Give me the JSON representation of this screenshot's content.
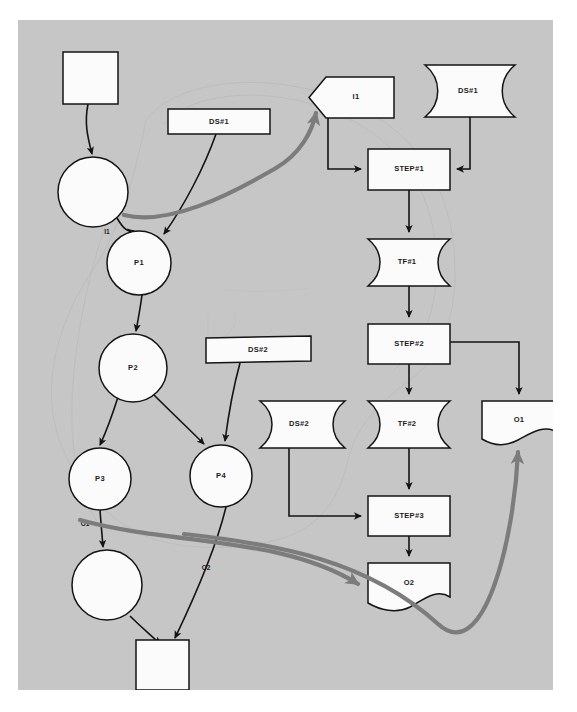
{
  "caption": {
    "clipped_text_top": ""
  },
  "diagram": {
    "type": "dfd-to-flowchart-mapping",
    "background_color": "#c6c6c6",
    "node_fill": "#fbfbfb",
    "node_stroke": "#141414",
    "mapping_arrow_color": "#7c7c7c",
    "boundary_color": "#bdbdbd",
    "left_panel_title": "",
    "right_panel_title": "",
    "dfd_nodes": [
      {
        "id": "ext-source",
        "label": "",
        "shape": "rectangle",
        "x": 45,
        "y": 32,
        "w": 55,
        "h": 52
      },
      {
        "id": "ds1-store",
        "label": "DS#1",
        "shape": "open-rectangle",
        "x": 150,
        "y": 89,
        "w": 102,
        "h": 25
      },
      {
        "id": "proc-top",
        "label": "",
        "shape": "circle",
        "cx": 75,
        "cy": 172,
        "r": 35
      },
      {
        "id": "p1",
        "label": "P1",
        "shape": "circle",
        "cx": 121,
        "cy": 243,
        "r": 32
      },
      {
        "id": "p2",
        "label": "P2",
        "shape": "circle",
        "cx": 115,
        "cy": 348,
        "r": 34
      },
      {
        "id": "ds2-store",
        "label": "DS#2",
        "shape": "open-rectangle",
        "x": 188,
        "y": 318,
        "w": 105,
        "h": 25
      },
      {
        "id": "p3",
        "label": "P3",
        "shape": "circle",
        "cx": 82,
        "cy": 459,
        "r": 31
      },
      {
        "id": "p4",
        "label": "P4",
        "shape": "circle",
        "cx": 203,
        "cy": 456,
        "r": 31
      },
      {
        "id": "proc-bottom",
        "label": "",
        "shape": "circle",
        "cx": 89,
        "cy": 565,
        "r": 35
      },
      {
        "id": "ext-sink",
        "label": "",
        "shape": "rectangle",
        "x": 118,
        "y": 620,
        "w": 53,
        "h": 50
      }
    ],
    "dfd_edge_labels": [
      {
        "id": "edge-i1",
        "label": "I1",
        "x": 89,
        "y": 212
      },
      {
        "id": "edge-o1",
        "label": "O1",
        "x": 67,
        "y": 504
      },
      {
        "id": "edge-o2",
        "label": "O2",
        "x": 188,
        "y": 548
      }
    ],
    "flowchart_nodes": [
      {
        "id": "fc-i1",
        "label": "I1",
        "shape": "input-pentagon",
        "x": 291,
        "y": 57,
        "w": 85,
        "h": 41
      },
      {
        "id": "fc-ds1",
        "label": "DS#1",
        "shape": "stored-data",
        "x": 407,
        "y": 45,
        "w": 90,
        "h": 52
      },
      {
        "id": "fc-step1",
        "label": "STEP#1",
        "shape": "process",
        "x": 350,
        "y": 129,
        "w": 82,
        "h": 41
      },
      {
        "id": "fc-tf1",
        "label": "TF#1",
        "shape": "stored-data",
        "x": 350,
        "y": 219,
        "w": 82,
        "h": 47
      },
      {
        "id": "fc-step2",
        "label": "STEP#2",
        "shape": "process",
        "x": 350,
        "y": 304,
        "w": 82,
        "h": 40
      },
      {
        "id": "fc-ds2",
        "label": "DS#2",
        "shape": "stored-data",
        "x": 242,
        "y": 381,
        "w": 85,
        "h": 47
      },
      {
        "id": "fc-tf2",
        "label": "TF#2",
        "shape": "stored-data",
        "x": 350,
        "y": 381,
        "w": 82,
        "h": 47
      },
      {
        "id": "fc-o1",
        "label": "O1",
        "shape": "document",
        "x": 464,
        "y": 381,
        "w": 75,
        "h": 46
      },
      {
        "id": "fc-step3",
        "label": "STEP#3",
        "shape": "process",
        "x": 350,
        "y": 476,
        "w": 82,
        "h": 40
      },
      {
        "id": "fc-o2",
        "label": "O2",
        "shape": "document",
        "x": 350,
        "y": 543,
        "w": 82,
        "h": 46
      }
    ],
    "mapping_arrows": [
      {
        "id": "map-i1",
        "from": "proc-top",
        "to": "fc-i1",
        "label": "I1"
      },
      {
        "id": "map-o2",
        "from": "edge-o1",
        "to": "fc-o2",
        "label": "O2"
      },
      {
        "id": "map-o1",
        "from": "edge-o2-area",
        "to": "fc-o1",
        "label": "O1"
      }
    ]
  }
}
